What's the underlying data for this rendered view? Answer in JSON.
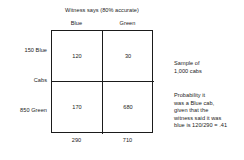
{
  "figure": {
    "title": "Witness says (80% accurate)",
    "column_headers": [
      "Blue",
      "Green"
    ],
    "row_labels": {
      "top": "150 Blue",
      "axis": "Cabs",
      "bottom": "850 Green"
    },
    "cells": {
      "blue_blue": "120",
      "blue_green": "30",
      "green_blue": "170",
      "green_green": "680"
    },
    "column_totals": [
      "290",
      "710"
    ],
    "notes": {
      "sample": [
        "Sample of",
        "1,000 cabs"
      ],
      "probability": [
        "Probability it",
        "was a Blue cab,",
        "given that the",
        "witness said it was",
        "blue is 120/290  =  .41"
      ]
    },
    "colors": {
      "ink": "#1b1b1b",
      "background": "#ffffff"
    }
  },
  "chart_data": {
    "type": "table",
    "title": "Witness says (80% accurate)",
    "columns": [
      "Blue",
      "Green"
    ],
    "rows": [
      "150 Blue",
      "850 Green"
    ],
    "values": [
      [
        120,
        30
      ],
      [
        170,
        680
      ]
    ],
    "column_totals": [
      290,
      710
    ],
    "row_totals": [
      150,
      850
    ],
    "grand_total": 1000,
    "row_axis_label": "Cabs",
    "annotations": [
      "Sample of 1,000 cabs",
      "Probability it was a Blue cab, given that the witness said it was blue is 120/290 = .41"
    ]
  }
}
